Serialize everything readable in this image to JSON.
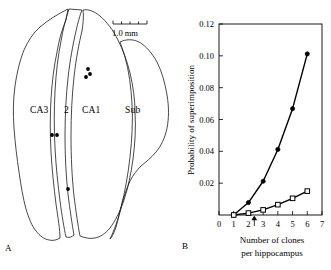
{
  "figure": {
    "panels": [
      {
        "letter": "A",
        "name": "hippocampus-section"
      },
      {
        "letter": "B",
        "name": "superimposition-probability-plot"
      }
    ]
  },
  "panel_a": {
    "letter": "A",
    "scalebar_label": "1.0 mm",
    "region_labels": [
      {
        "key": "ca3",
        "text": "CA3"
      },
      {
        "key": "ca2",
        "text": "2"
      },
      {
        "key": "ca1",
        "text": "CA1"
      },
      {
        "key": "sub",
        "text": "Sub"
      }
    ],
    "clone_dots": [
      {
        "x": 88,
        "y": 69
      },
      {
        "x": 90,
        "y": 74
      },
      {
        "x": 86,
        "y": 77
      },
      {
        "x": 52,
        "y": 135
      },
      {
        "x": 57,
        "y": 135
      },
      {
        "x": 68,
        "y": 189
      }
    ]
  },
  "panel_b": {
    "letter": "B"
  },
  "chart_data": {
    "type": "line",
    "title": "",
    "xlabel": "Number of clones per hippocampus",
    "xlabel_line1": "Number of clones",
    "xlabel_line2": "per hippocampus",
    "ylabel": "Probability of superimposition",
    "xlim": [
      0,
      7
    ],
    "ylim": [
      0,
      0.12
    ],
    "xticks": [
      0,
      1,
      2,
      3,
      4,
      5,
      6,
      7
    ],
    "xticklabels": [
      "0",
      "1",
      "2",
      "3",
      "4",
      "5",
      "6",
      "7"
    ],
    "yticks": [
      0.02,
      0.04,
      0.06,
      0.08,
      0.1,
      0.12
    ],
    "yticklabels": [
      "0.02",
      "0.04",
      "0.06",
      "0.08",
      "0.10",
      "0.12"
    ],
    "grid": false,
    "legend": "none",
    "annotations": [
      {
        "name": "arrow-marker",
        "x": 2.4,
        "y": 0,
        "direction": "up",
        "label": ""
      }
    ],
    "x": [
      1,
      2,
      3,
      4,
      5,
      6
    ],
    "series": [
      {
        "name": "filled-circle-series",
        "marker": "filled-circle",
        "values": [
          0.0,
          0.0078,
          0.0212,
          0.0412,
          0.0668,
          0.1012
        ]
      },
      {
        "name": "open-square-series",
        "marker": "open-square",
        "values": [
          0.0,
          0.0012,
          0.0032,
          0.0065,
          0.0105,
          0.015
        ]
      }
    ]
  },
  "colors": {
    "ink": "#000000",
    "background": "#ffffff",
    "outline": "#1a1a1a"
  }
}
